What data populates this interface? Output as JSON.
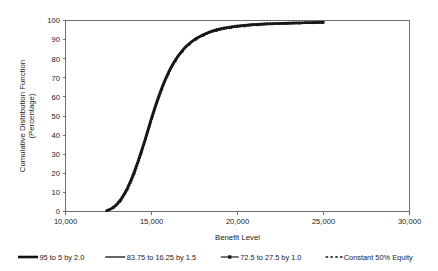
{
  "chart_data": {
    "type": "line",
    "title": "",
    "xlabel": "Benefit Level",
    "ylabel": "Cumulative Distribution Function (Percentage)",
    "ylabel_line1": "Cumulative Distribution Function",
    "ylabel_line2": "(Percentage)",
    "xlim": [
      10000,
      30000
    ],
    "ylim": [
      0,
      100
    ],
    "xticks": [
      10000,
      15000,
      20000,
      25000,
      30000
    ],
    "xtick_labels": [
      "10,000",
      "15,000",
      "20,000",
      "25,000",
      "30,000"
    ],
    "yticks": [
      0,
      10,
      20,
      30,
      40,
      50,
      60,
      70,
      80,
      90,
      100
    ],
    "ytick_labels": [
      "0",
      "10",
      "20",
      "30",
      "40",
      "50",
      "60",
      "70",
      "80",
      "90",
      "100"
    ],
    "grid": false,
    "legend_position": "below",
    "x": [
      12400,
      12600,
      12800,
      13000,
      13200,
      13400,
      13600,
      13800,
      14000,
      14200,
      14400,
      14600,
      14800,
      15000,
      15200,
      15400,
      15600,
      15800,
      16000,
      16200,
      16400,
      16600,
      16800,
      17000,
      17200,
      17400,
      17600,
      17800,
      18000,
      18400,
      18800,
      19200,
      19600,
      20000,
      20400,
      20800,
      21200,
      21600,
      22000,
      22400,
      22800,
      23200,
      23600,
      24000,
      24400,
      25000
    ],
    "series": [
      {
        "name": "95 to 5 by 2.0",
        "style": "solid-thick",
        "color": "#111111",
        "marker": "none",
        "values": [
          0.5,
          1.2,
          2.4,
          4.0,
          6.2,
          9.0,
          12.4,
          16.4,
          21.0,
          26.0,
          31.4,
          37.0,
          43.0,
          49.0,
          54.6,
          60.0,
          64.8,
          69.2,
          73.2,
          76.6,
          79.6,
          82.2,
          84.4,
          86.4,
          88.0,
          89.4,
          90.6,
          91.6,
          92.5,
          94.0,
          95.1,
          95.9,
          96.5,
          97.0,
          97.4,
          97.7,
          97.9,
          98.1,
          98.3,
          98.4,
          98.5,
          98.6,
          98.7,
          98.8,
          98.9,
          99.0
        ]
      },
      {
        "name": "83.75 to 16.25 by 1.5",
        "style": "solid-thin",
        "color": "#222222",
        "marker": "none",
        "values": [
          0.4,
          1.0,
          2.2,
          3.8,
          6.0,
          8.7,
          12.0,
          16.0,
          20.6,
          25.6,
          31.0,
          36.6,
          42.6,
          48.6,
          54.2,
          59.6,
          64.5,
          68.9,
          72.9,
          76.3,
          79.3,
          81.9,
          84.1,
          86.1,
          87.8,
          89.2,
          90.4,
          91.4,
          92.3,
          93.8,
          94.9,
          95.7,
          96.3,
          96.8,
          97.2,
          97.5,
          97.8,
          98.0,
          98.2,
          98.3,
          98.4,
          98.5,
          98.6,
          98.7,
          98.8,
          98.9
        ]
      },
      {
        "name": "72.5 to 27.5 by 1.0",
        "style": "solid-marker",
        "color": "#1a1a1a",
        "marker": "square",
        "values": [
          0.3,
          0.9,
          2.0,
          3.5,
          5.6,
          8.3,
          11.6,
          15.5,
          20.0,
          25.0,
          30.4,
          36.0,
          42.0,
          48.0,
          53.6,
          59.0,
          63.9,
          68.3,
          72.3,
          75.7,
          78.8,
          81.4,
          83.7,
          85.7,
          87.4,
          88.9,
          90.1,
          91.1,
          92.0,
          93.6,
          94.7,
          95.5,
          96.1,
          96.6,
          97.0,
          97.4,
          97.6,
          97.9,
          98.1,
          98.2,
          98.3,
          98.4,
          98.5,
          98.6,
          98.7,
          98.8
        ]
      },
      {
        "name": "Constant 50% Equity",
        "style": "dotted",
        "color": "#111111",
        "marker": "none",
        "values": [
          0.3,
          0.8,
          1.8,
          3.2,
          5.2,
          7.8,
          11.0,
          14.8,
          19.2,
          24.2,
          29.6,
          35.2,
          41.2,
          47.2,
          52.9,
          58.3,
          63.3,
          67.9,
          72.0,
          75.6,
          78.8,
          81.6,
          84.0,
          86.1,
          87.9,
          89.5,
          90.8,
          91.9,
          92.9,
          94.5,
          95.6,
          96.4,
          97.0,
          97.5,
          97.9,
          98.2,
          98.4,
          98.6,
          98.7,
          98.8,
          98.9,
          99.0,
          99.1,
          99.2,
          99.2,
          99.3
        ]
      }
    ]
  },
  "legend": {
    "items": [
      {
        "label": "95 to 5 by 2.0",
        "style": "solid-thick"
      },
      {
        "label": "83.75 to 16.25 by 1.5",
        "style": "solid-thin"
      },
      {
        "label": "72.5 to 27.5 by 1.0",
        "style": "solid-marker"
      },
      {
        "label": "Constant 50% Equity",
        "style": "dotted"
      }
    ]
  }
}
